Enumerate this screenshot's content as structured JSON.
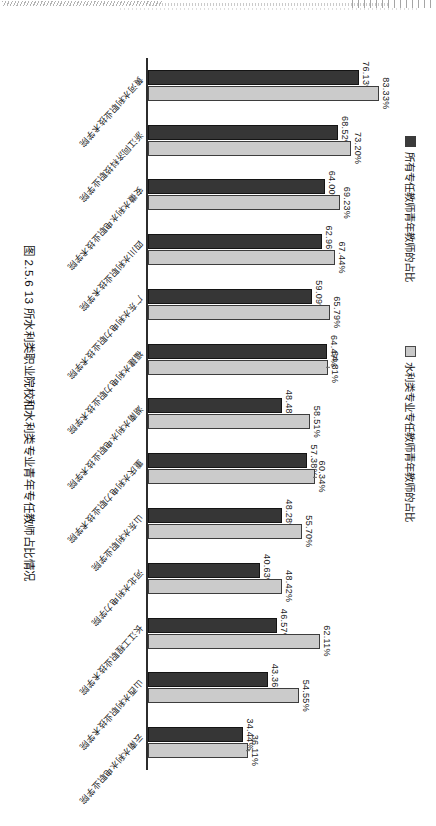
{
  "page": {
    "kind": "scanned-book-page-sideways"
  },
  "legend": {
    "items": [
      {
        "label": "所有专任教师青年教师的占比",
        "swatch": "dark",
        "color": "#363636"
      },
      {
        "label": "水利类专业专任教师青年教师的占比",
        "swatch": "light",
        "color": "#cbcbcb"
      }
    ]
  },
  "caption": {
    "text": "图 2.5.6  13 所水利类职业院校和水利类专业青年专任教师占比情况"
  },
  "chart_data": {
    "type": "bar",
    "orientation": "vertical-rendered-rotated-90",
    "title": "图 2.5.6  13 所水利类职业院校和水利类专业青年专任教师占比情况",
    "xlabel": "",
    "ylabel": "",
    "ylim": [
      0,
      90
    ],
    "grid": false,
    "legend_position": "top-left",
    "categories": [
      "黄河水利职业技术学院",
      "浙江同济科技职业学院",
      "安徽水利水电职业技术学院",
      "四川水利职业技术学院",
      "广东水利电力职业技术学院",
      "福建水利电力职业技术学院",
      "湖南水利水电职业技术学院",
      "重庆水利电力职业技术学院",
      "山东水利职业学院",
      "河北水利电力学院",
      "长江工程职业技术学院",
      "山西水利职业技术学院",
      "云南水利水电职业学院"
    ],
    "series": [
      {
        "name": "所有专任教师青年教师的占比",
        "color": "#363636",
        "values": [
          76.13,
          68.52,
          64.0,
          62.96,
          59.09,
          64.47,
          48.48,
          57.38,
          48.28,
          40.63,
          46.57,
          43.36,
          34.44
        ],
        "labels": [
          "76.13%",
          "68.52%",
          "64.00%",
          "62.96%",
          "59.09%",
          "64.47%",
          "48.48%",
          "57.38%",
          "48.28%",
          "40.63%",
          "46.57%",
          "43.36%",
          "34.44%"
        ]
      },
      {
        "name": "水利类专业专任教师青年教师的占比",
        "color": "#cbcbcb",
        "values": [
          83.33,
          73.2,
          69.23,
          67.44,
          65.79,
          64.81,
          58.51,
          60.34,
          55.7,
          48.42,
          62.11,
          54.55,
          36.11
        ],
        "labels": [
          "83.33%",
          "73.20%",
          "69.23%",
          "67.44%",
          "65.79%",
          "64.81%",
          "58.51%",
          "60.34%",
          "55.70%",
          "48.42%",
          "62.11%",
          "54.55%",
          "36.11%"
        ],
        "leader_line_indices": [
          5,
          7,
          12
        ]
      }
    ]
  }
}
